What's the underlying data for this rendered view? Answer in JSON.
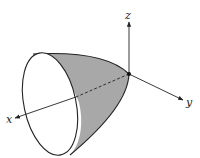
{
  "diagram": {
    "type": "3d-surface",
    "axes": {
      "x": {
        "label": "x"
      },
      "y": {
        "label": "y"
      },
      "z": {
        "label": "z"
      }
    },
    "colors": {
      "surface_fill": "#a8a8a8",
      "stroke": "#222222",
      "background": "#ffffff"
    }
  }
}
